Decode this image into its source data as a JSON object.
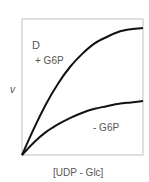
{
  "chart_data": {
    "type": "line",
    "panel_label": "D",
    "title": "",
    "xlabel": "[UDP - Glc]",
    "ylabel": "v",
    "grid": false,
    "legend": "inline annotations",
    "x": [
      0,
      0.1,
      0.2,
      0.3,
      0.4,
      0.5,
      0.6,
      0.7,
      0.8,
      0.9,
      1.0
    ],
    "series": [
      {
        "name": "+ G6P",
        "values": [
          0,
          0.21,
          0.4,
          0.56,
          0.69,
          0.79,
          0.87,
          0.92,
          0.96,
          0.98,
          0.99
        ]
      },
      {
        "name": "- G6P",
        "values": [
          0,
          0.1,
          0.18,
          0.24,
          0.29,
          0.33,
          0.36,
          0.38,
          0.4,
          0.41,
          0.42
        ]
      }
    ],
    "xlim": [
      0,
      1
    ],
    "ylim": [
      0,
      1.06
    ]
  },
  "labels": {
    "panel": "D",
    "ylabel": "v",
    "xlabel": "[UDP - Glc]",
    "plus_g6p": "+ G6P",
    "minus_g6p": "- G6P"
  }
}
